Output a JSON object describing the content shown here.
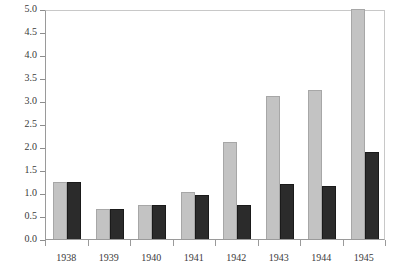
{
  "chart_data": {
    "type": "bar",
    "title": "",
    "subtitle": "",
    "xlabel": "",
    "ylabel": "",
    "categories": [
      "1938",
      "1939",
      "1940",
      "1941",
      "1942",
      "1943",
      "1944",
      "1945"
    ],
    "series": [
      {
        "name": "series-light",
        "color": "#c3c3c3",
        "values": [
          1.25,
          0.65,
          0.75,
          1.02,
          2.1,
          3.1,
          3.25,
          5.0
        ]
      },
      {
        "name": "series-dark",
        "color": "#2b2b2b",
        "values": [
          1.25,
          0.65,
          0.73,
          0.95,
          0.75,
          1.2,
          1.15,
          1.9
        ]
      }
    ],
    "ylim": [
      0.0,
      5.0
    ],
    "ytick_step": 0.5,
    "yticks": [
      "0.0",
      "0.5",
      "1.0",
      "1.5",
      "2.0",
      "2.5",
      "3.0",
      "3.5",
      "4.0",
      "4.5",
      "5.0"
    ],
    "grid": false,
    "legend": "none"
  }
}
